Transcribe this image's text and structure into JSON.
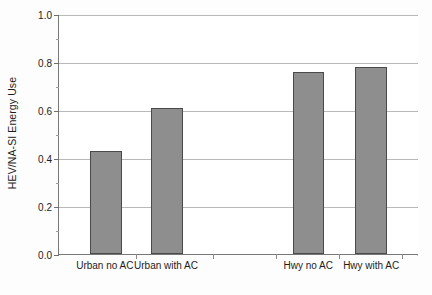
{
  "chart_data": {
    "type": "bar",
    "title": "",
    "xlabel": "",
    "ylabel": "HEV/NA-SI Energy Use",
    "categories": [
      "Urban no AC",
      "Urban with AC",
      "Hwy no AC",
      "Hwy with AC"
    ],
    "values": [
      0.43,
      0.61,
      0.76,
      0.78
    ],
    "ylim": [
      0.0,
      1.0
    ],
    "y_major_ticks": [
      0.0,
      0.2,
      0.4,
      0.6,
      0.8,
      1.0
    ],
    "y_tick_labels": [
      "0.0",
      "0.2",
      "0.4",
      "0.6",
      "0.8",
      "1.0"
    ],
    "y_minor_ticks": [
      0.1,
      0.3,
      0.5,
      0.7,
      0.9
    ],
    "grid": true,
    "grid_axis": "y",
    "legend": false,
    "legend_position": "none",
    "bar_color": "#8e8e8e",
    "bar_edge_color": "#4a4a4a",
    "gridline_color": "#b9b9b9",
    "axis_color": "#787878",
    "background_color": "#ffffff",
    "bar_slots": [
      {
        "label": "Urban no AC",
        "value": 0.43,
        "center_pct": 13.0,
        "width_pct": 8.9
      },
      {
        "label": "Urban with AC",
        "value": 0.61,
        "center_pct": 30.0,
        "width_pct": 8.9
      },
      {
        "label": "Hwy no AC",
        "value": 0.76,
        "center_pct": 69.5,
        "width_pct": 8.9
      },
      {
        "label": "Hwy with AC",
        "value": 0.78,
        "center_pct": 87.0,
        "width_pct": 8.9
      }
    ],
    "x_tick_positions_pct": [
      21.5,
      43.0,
      60.5,
      78.0,
      95.5
    ]
  }
}
